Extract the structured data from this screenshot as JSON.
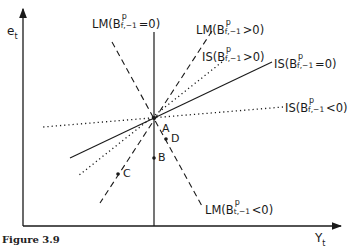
{
  "figure": {
    "caption": "Figure 3.9",
    "y_axis_label": "e",
    "y_axis_sub": "t",
    "x_axis_label": "Y",
    "x_axis_sub": "t"
  },
  "curves": [
    {
      "id": "lm_zero",
      "name": "LM",
      "sub": "f,−1",
      "sup": "p",
      "cond": "=0)",
      "style": "solid"
    },
    {
      "id": "lm_pos",
      "name": "LM",
      "sub": "f,−1",
      "sup": "p",
      "cond": ">0)",
      "style": "dashed"
    },
    {
      "id": "is_pos",
      "name": "IS",
      "sub": "f,−1",
      "sup": "p",
      "cond": ">0)",
      "style": "dotted"
    },
    {
      "id": "is_zero",
      "name": "IS",
      "sub": "f,−1",
      "sup": "p",
      "cond": "=0)",
      "style": "solid"
    },
    {
      "id": "is_neg",
      "name": "IS",
      "sub": "f,−1",
      "sup": "p",
      "cond": "<0)",
      "style": "dotted"
    },
    {
      "id": "lm_neg",
      "name": "LM",
      "sub": "t,−1",
      "sup": "p",
      "cond": "<0)",
      "style": "dashed"
    }
  ],
  "points": {
    "a": "A",
    "b": "B",
    "c": "C",
    "d": "D"
  },
  "label_prefix": "(B"
}
